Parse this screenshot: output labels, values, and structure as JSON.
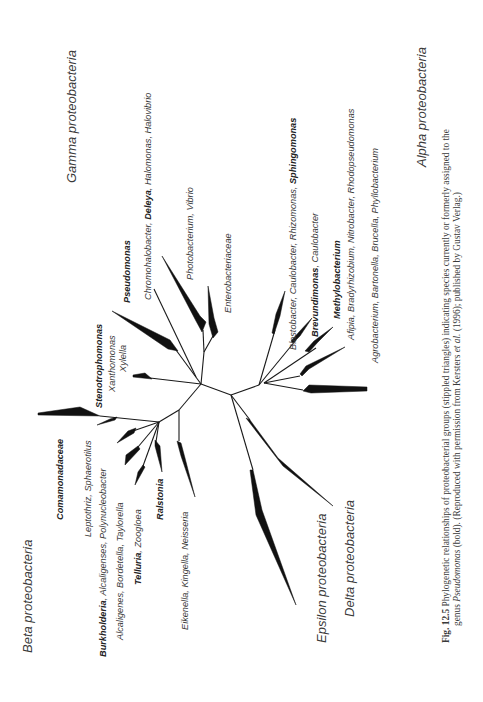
{
  "figure": {
    "orientation": "rotated-90-ccw",
    "groups": {
      "gamma": "Gamma proteobacteria",
      "beta": "Beta proteobacteria",
      "alpha": "Alpha proteobacteria",
      "epsilon": "Epsilon proteobacteria",
      "delta": "Delta proteobacteria"
    },
    "gamma_taxa": {
      "stenotrophomonas": "Stenotrophomonas",
      "xanthomonas": "Xanthomonas",
      "xylella": "Xylella",
      "pseudomonas": "Pseudomonas",
      "chromo_a": "Chromohalobacter, ",
      "chromo_b": "Deleya",
      "chromo_c": ", Halomonas, Halovibrio",
      "photobacterium": "Photobacterium, Vibrio",
      "enterobacteriaceae": "Enterobacteriaceae"
    },
    "beta_taxa": {
      "comamonadaceae": "Comamonadaceae",
      "leptothrix": "Leptothriz, Sphaerotilus",
      "burkholderia_a": "Burkholderia",
      "burkholderia_b": ", Alcaligenses, Polynucleobacter",
      "alcaligenes": "Alcaligenes, Bordetella, Taylorella",
      "telluria_a": "Telluria",
      "telluria_b": ", Zoogloea",
      "ralstonia": "Ralstonia",
      "eikenella": "Eikenella, Kingella, Neisseria"
    },
    "alpha_taxa": {
      "blasto_a": "Blastobacter, Caulobacter, Rhizomonas, ",
      "blasto_b": "Sphingomonas",
      "brevundimonas_a": "Brevundimonas",
      "brevundimonas_b": ", Caulobacter",
      "methylobacterium": "Methylobacterium",
      "afipia": "Afipia, Bradyrhizobium, Nitrobacter, Rhodopseudomonas",
      "agrobacterium": "Agrobacterium, Bartonella, Brucella, Phyllobacterium"
    },
    "caption": {
      "label": "Fig. 12.5",
      "line1": " Phylogenetic relationships of proteobacterial groups (stippled triangles) indicating species currently or formerly assigned to the",
      "line2_a": "genus ",
      "line2_genus": "Pseudomonas",
      "line2_b": " (bold). (Reproduced with permission from Kersters ",
      "line2_etal": "et al.",
      "line2_c": " (1996); published by Gustav Verlag.)"
    }
  }
}
